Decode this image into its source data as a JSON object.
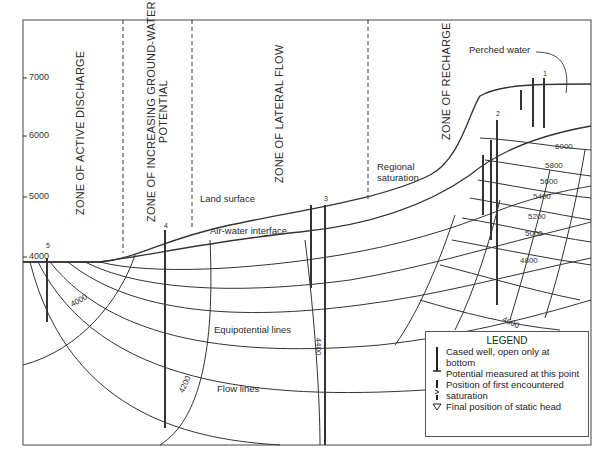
{
  "diagram": {
    "y_axis": {
      "ticks": [
        {
          "label": "7000",
          "y": 78
        },
        {
          "label": "6000",
          "y": 136
        },
        {
          "label": "5000",
          "y": 197
        },
        {
          "label": "4000",
          "y": 257
        }
      ]
    },
    "zones": [
      {
        "label": "ZONE OF ACTIVE DISCHARGE"
      },
      {
        "label": "ZONE OF INCREASING GROUND-WATER",
        "label2": "POTENTIAL"
      },
      {
        "label": "ZONE OF LATERAL FLOW"
      },
      {
        "label": "ZONE OF RECHARGE"
      }
    ],
    "annotations": {
      "perched_water": "Perched water",
      "regional_saturation_1": "Regional",
      "regional_saturation_2": "saturation",
      "land_surface": "Land surface",
      "air_water_interface": "Air-water interface",
      "equipotential_lines": "Equipotential lines",
      "flow_lines": "Flow lines"
    },
    "wells": [
      {
        "number": "1"
      },
      {
        "number": "2"
      },
      {
        "number": "3"
      },
      {
        "number": "4"
      },
      {
        "number": "5"
      }
    ],
    "contours": [
      {
        "label": "6000"
      },
      {
        "label": "5800"
      },
      {
        "label": "5600"
      },
      {
        "label": "5400"
      },
      {
        "label": "5200"
      },
      {
        "label": "5000"
      },
      {
        "label": "4800"
      },
      {
        "label": "4600"
      },
      {
        "label": "4400"
      },
      {
        "label": "4200"
      },
      {
        "label": "4000"
      }
    ],
    "legend": {
      "title": "LEGEND",
      "items": [
        {
          "line1": "Cased well, open only at",
          "line2": "bottom"
        },
        {
          "line1": "Potential measured at this point"
        },
        {
          "line1": "Position of first encountered",
          "line2": "saturation"
        },
        {
          "line1": "Final position of static head"
        }
      ]
    }
  }
}
